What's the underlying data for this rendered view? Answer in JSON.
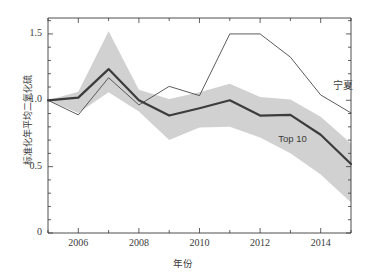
{
  "chart_data": {
    "type": "line",
    "title": "",
    "xlabel": "年份",
    "ylabel": "标准化年平均二氧化硫",
    "xlim": [
      2005,
      2015
    ],
    "ylim": [
      0,
      1.62
    ],
    "xticks": [
      2006,
      2008,
      2010,
      2012,
      2014
    ],
    "xticklabels": [
      "2006",
      "2008",
      "2010",
      "2012",
      "2014"
    ],
    "yticks": [
      0,
      0.5,
      1.0,
      1.5
    ],
    "yticklabels": [
      "0",
      "0.5",
      "1.0",
      "1.5"
    ],
    "minor_ticks": true,
    "grid": false,
    "legend_position": "inline-annotations",
    "x": [
      2005,
      2006,
      2007,
      2008,
      2009,
      2010,
      2011,
      2012,
      2013,
      2014,
      2015
    ],
    "series": [
      {
        "name": "Top 10",
        "label": "Top 10",
        "color": "#3c3c3c",
        "linewidth": 2.2,
        "values": [
          1.0,
          1.02,
          1.235,
          1.0,
          0.885,
          0.94,
          1.0,
          0.885,
          0.89,
          0.74,
          0.52
        ]
      },
      {
        "name": "宁夏",
        "label": "宁夏",
        "color": "#4a4a4a",
        "linewidth": 0.9,
        "values": [
          1.0,
          0.89,
          1.17,
          0.965,
          1.105,
          1.035,
          1.5,
          1.5,
          1.325,
          1.04,
          0.905
        ]
      }
    ],
    "band": {
      "name": "Top 10 range",
      "fill_color": "#c9c9c9",
      "opacity": 0.85,
      "upper": [
        1.0,
        1.065,
        1.52,
        1.08,
        1.01,
        1.06,
        1.125,
        1.025,
        1.005,
        0.875,
        0.675
      ],
      "lower": [
        1.0,
        0.905,
        1.06,
        0.915,
        0.7,
        0.795,
        0.8,
        0.72,
        0.6,
        0.44,
        0.23
      ]
    },
    "annotations": [
      {
        "text": "宁夏",
        "x": 2014.4,
        "y": 1.12
      },
      {
        "text": "Top 10",
        "x": 2012.6,
        "y": 0.7
      }
    ],
    "axis_color": "#3a3a3a",
    "background": "#ffffff"
  }
}
